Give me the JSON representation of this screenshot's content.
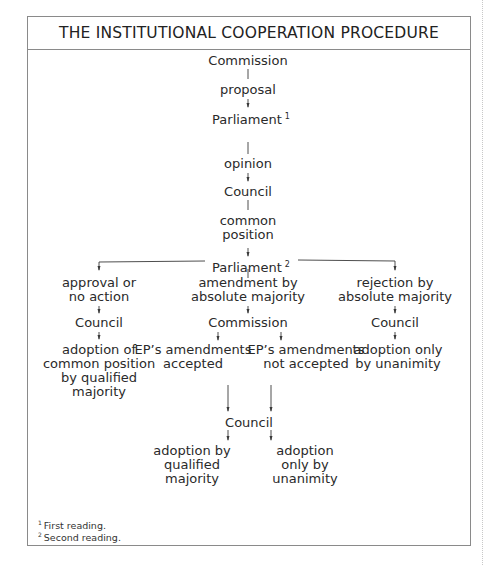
{
  "title": "THE INSTITUTIONAL COOPERATION PROCEDURE",
  "nodes": {
    "commission_top": "Commission",
    "proposal": "proposal",
    "parliament_1": "Parliament",
    "parliament_1_sup": "1",
    "opinion": "opinion",
    "council_1": "Council",
    "common_position_1": "common",
    "common_position_2": "position",
    "parliament_2": "Parliament",
    "parliament_2_sup": "2",
    "approval_1": "approval or",
    "approval_2": "no action",
    "amendment_1": "amendment by",
    "amendment_2": "absolute majority",
    "rejection_1": "rejection by",
    "rejection_2": "absolute majority",
    "council_left": "Council",
    "commission_mid": "Commission",
    "council_right": "Council",
    "adoption_common_1": "adoption of",
    "adoption_common_2": "common position",
    "adoption_common_3": "by qualified",
    "adoption_common_4": "majority",
    "ep_accepted_1": "EP’s amendments",
    "ep_accepted_2": "accepted",
    "ep_not_accepted_1": "EP’s amendments",
    "ep_not_accepted_2": "not accepted",
    "adoption_unanimity_right_1": "adoption only",
    "adoption_unanimity_right_2": "by unanimity",
    "council_bottom": "Council",
    "adoption_qm_1": "adoption by",
    "adoption_qm_2": "qualified",
    "adoption_qm_3": "majority",
    "adoption_un_1": "adoption",
    "adoption_un_2": "only by",
    "adoption_un_3": "unanimity"
  },
  "footnotes": [
    {
      "mark": "1",
      "text": "First reading."
    },
    {
      "mark": "2",
      "text": "Second reading."
    }
  ],
  "colors": {
    "line": "#3a3a3a",
    "border": "#8a8a8a",
    "text": "#2a2a2a"
  }
}
